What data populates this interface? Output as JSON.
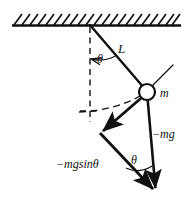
{
  "figure": {
    "type": "physics-vector-diagram",
    "background_color": "#ffffff",
    "stroke_color": "#101010",
    "labels": {
      "length": "L",
      "mass": "m",
      "weight": "−mg",
      "tangential_force": "−mgsinθ",
      "angle_at_pivot": "θ",
      "angle_at_vector": "θ"
    },
    "geometry": {
      "ceiling": {
        "x1": 12,
        "y1": 25,
        "x2": 180,
        "y2": 25,
        "hatch_count": 21,
        "hatch_direction": "right-leaning",
        "hatch_length": 11
      },
      "pivot": {
        "x": 90,
        "y": 25
      },
      "bob": {
        "x": 147,
        "y": 92,
        "radius": 8
      },
      "equilibrium_point": {
        "x": 90,
        "y": 112
      },
      "dashed_vertical": {
        "x": 90,
        "y1": 25,
        "y2": 122
      },
      "string": {
        "x1": 90,
        "y1": 25,
        "x2": 147,
        "y2": 92
      },
      "weight_vector": {
        "x1": 147,
        "y1": 92,
        "x2": 156,
        "y2": 193
      },
      "tangential_vector": {
        "x1": 147,
        "y1": 92,
        "x2": 100,
        "y2": 133
      },
      "resultant_vector": {
        "x1": 100,
        "y1": 133,
        "x2": 156,
        "y2": 193
      },
      "tangent_line": {
        "x1": 152,
        "y1": 86,
        "x2": 172,
        "y2": 66
      },
      "angle_arc_pivot_radius": 34,
      "angle_arc_vector_radius": 26
    }
  }
}
